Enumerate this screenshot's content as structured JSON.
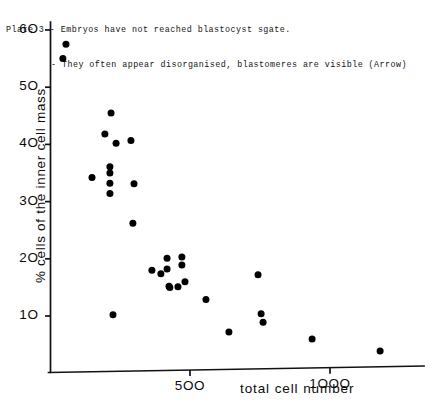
{
  "caption": {
    "line1": "Plate 3 - Embryos have not reached blastocyst sgate.",
    "line2": "- They often appear disorganised, blastomeres are visible (Arrow)"
  },
  "chart_data": {
    "type": "scatter",
    "title": "",
    "xlabel": "total cell number",
    "ylabel": "% cells of the inner cell mass",
    "xlim": [
      0,
      1260
    ],
    "ylim": [
      0,
      63
    ],
    "xticks": [
      500,
      1000
    ],
    "xtick_labels": [
      "500",
      "1000"
    ],
    "yticks": [
      10,
      20,
      30,
      40,
      50,
      60
    ],
    "ytick_labels": [
      "10",
      "20",
      "30",
      "40",
      "50",
      "60"
    ],
    "grid": false,
    "legend": null,
    "marker": "filled-circle",
    "marker_color": "#000000",
    "points": [
      {
        "x": 57,
        "y": 57.5
      },
      {
        "x": 46,
        "y": 55.0
      },
      {
        "x": 150,
        "y": 34.2
      },
      {
        "x": 218,
        "y": 45.5
      },
      {
        "x": 196,
        "y": 41.8
      },
      {
        "x": 236,
        "y": 40.2
      },
      {
        "x": 289,
        "y": 40.7
      },
      {
        "x": 214,
        "y": 36.1
      },
      {
        "x": 214,
        "y": 35.0
      },
      {
        "x": 214,
        "y": 33.2
      },
      {
        "x": 214,
        "y": 31.4
      },
      {
        "x": 300,
        "y": 33.1
      },
      {
        "x": 225,
        "y": 10.2
      },
      {
        "x": 296,
        "y": 26.2
      },
      {
        "x": 364,
        "y": 18.0
      },
      {
        "x": 396,
        "y": 17.4
      },
      {
        "x": 418,
        "y": 20.1
      },
      {
        "x": 418,
        "y": 18.2
      },
      {
        "x": 471,
        "y": 20.3
      },
      {
        "x": 471,
        "y": 18.9
      },
      {
        "x": 482,
        "y": 16.0
      },
      {
        "x": 425,
        "y": 15.2
      },
      {
        "x": 428,
        "y": 15.0
      },
      {
        "x": 457,
        "y": 15.1
      },
      {
        "x": 557,
        "y": 12.9
      },
      {
        "x": 639,
        "y": 7.2
      },
      {
        "x": 743,
        "y": 17.2
      },
      {
        "x": 754,
        "y": 10.4
      },
      {
        "x": 761,
        "y": 8.9
      },
      {
        "x": 936,
        "y": 6.0
      },
      {
        "x": 1179,
        "y": 3.9
      }
    ]
  }
}
